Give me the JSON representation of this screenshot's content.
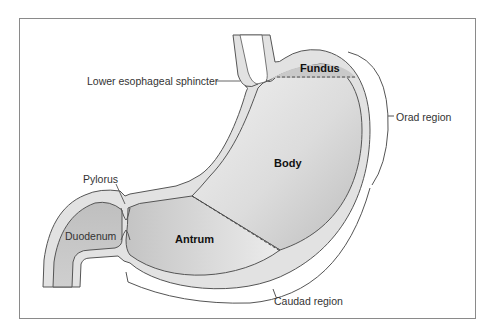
{
  "figure": {
    "type": "anatomical-diagram"
  },
  "labels": {
    "les": "Lower esophageal sphincter",
    "fundus": "Fundus",
    "body": "Body",
    "antrum": "Antrum",
    "pylorus": "Pylorus",
    "duodenum": "Duodenum",
    "orad": "Orad region",
    "caudad": "Caudad region"
  },
  "colors": {
    "wall": "#e2e2e2",
    "outline": "#555555",
    "lumen_light": "#eeeeee",
    "lumen_dark": "#bdbdbd",
    "frame": "#8a8a8a"
  }
}
